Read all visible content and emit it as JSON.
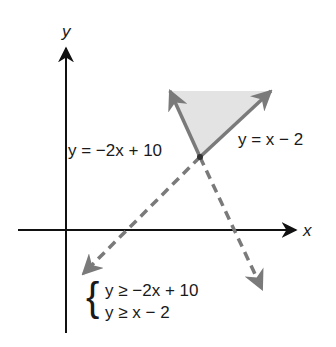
{
  "diagram": {
    "type": "system-of-linear-inequalities-graph",
    "axes": {
      "x_label": "x",
      "y_label": "y"
    },
    "lines": [
      {
        "id": "line1",
        "label": "y = −2x + 10",
        "style": "solid-then-dashed"
      },
      {
        "id": "line2",
        "label": "y = x − 2",
        "style": "solid-then-dashed"
      }
    ],
    "system": {
      "brace": "{",
      "inequalities": [
        "y ≥ −2x + 10",
        "y ≥ x − 2"
      ]
    },
    "colors": {
      "axis": "#111111",
      "boundary_line": "#7a7a7a",
      "shaded_region": "#e3e3e3",
      "vertex": "#333333",
      "text": "#1a1a1a"
    }
  }
}
